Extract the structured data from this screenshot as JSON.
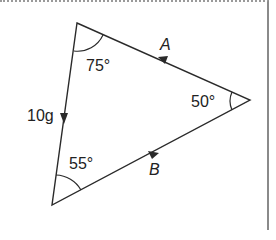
{
  "diagram": {
    "type": "vector-triangle",
    "vertices": {
      "top": [
        77,
        23
      ],
      "right": [
        250,
        100
      ],
      "bottom": [
        52,
        205
      ]
    },
    "colors": {
      "line": "#2a2a2a",
      "background": "#ffffff",
      "border": "#8a8a8a"
    },
    "sides": [
      {
        "id": "weight",
        "label": "10g",
        "direction": "top-to-bottom"
      },
      {
        "id": "A",
        "label": "A",
        "direction": "right-to-top"
      },
      {
        "id": "B",
        "label": "B",
        "direction": "bottom-to-right"
      }
    ],
    "angles": [
      {
        "vertex": "top",
        "label": "75°"
      },
      {
        "vertex": "right",
        "label": "50°"
      },
      {
        "vertex": "bottom",
        "label": "55°"
      }
    ]
  }
}
